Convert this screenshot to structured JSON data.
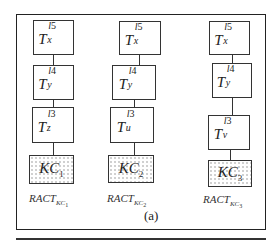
{
  "figure": {
    "caption": "(a)",
    "columns": [
      {
        "id": "col1",
        "nodes": [
          {
            "base": "T",
            "sup_letter": "l",
            "sup_num": "5",
            "sub": "x"
          },
          {
            "base": "T",
            "sup_letter": "l",
            "sup_num": "4",
            "sub": "y"
          },
          {
            "base": "T",
            "sup_letter": "l",
            "sup_num": "3",
            "sub": "z"
          }
        ],
        "kc": {
          "base": "KC",
          "sub": "1"
        },
        "ract": {
          "base": "RACT",
          "sub": "KC",
          "subsub": "1"
        }
      },
      {
        "id": "col2",
        "nodes": [
          {
            "base": "T",
            "sup_letter": "l",
            "sup_num": "5",
            "sub": "x"
          },
          {
            "base": "T",
            "sup_letter": "l",
            "sup_num": "4",
            "sub": "y"
          },
          {
            "base": "T",
            "sup_letter": "l",
            "sup_num": "3",
            "sub": "u"
          }
        ],
        "kc": {
          "base": "KC",
          "sub": "2"
        },
        "ract": {
          "base": "RACT",
          "sub": "KC",
          "subsub": "2"
        }
      },
      {
        "id": "col3",
        "nodes": [
          {
            "base": "T",
            "sup_letter": "l",
            "sup_num": "5",
            "sub": "x"
          },
          {
            "base": "T",
            "sup_letter": "l",
            "sup_num": "4",
            "sub": "y"
          },
          {
            "base": "T",
            "sup_letter": "l",
            "sup_num": "3",
            "sub": "v"
          }
        ],
        "kc": {
          "base": "KC",
          "sub": "3"
        },
        "ract": {
          "base": "RACT",
          "sub": "KC",
          "subsub": "3"
        }
      }
    ]
  }
}
